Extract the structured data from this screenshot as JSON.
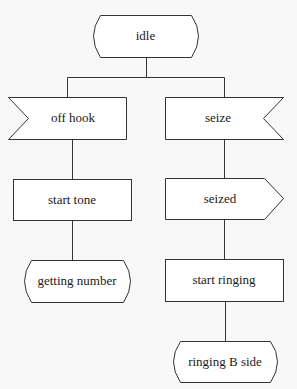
{
  "diagram": {
    "type": "SDL state transition diagram",
    "nodes": [
      {
        "id": "idle",
        "label": "idle",
        "shape": "state",
        "x": 86,
        "y": 15,
        "w": 119,
        "h": 42
      },
      {
        "id": "off_hook",
        "label": "off hook",
        "shape": "input-signal-left",
        "x": 8,
        "y": 97,
        "w": 118,
        "h": 42
      },
      {
        "id": "seize",
        "label": "seize",
        "shape": "input-signal-right",
        "x": 165,
        "y": 97,
        "w": 118,
        "h": 42
      },
      {
        "id": "start_tone",
        "label": "start tone",
        "shape": "task",
        "x": 13,
        "y": 179,
        "w": 118,
        "h": 41
      },
      {
        "id": "seized",
        "label": "seized",
        "shape": "output-signal",
        "x": 165,
        "y": 178,
        "w": 118,
        "h": 41
      },
      {
        "id": "getting_number",
        "label": "getting number",
        "shape": "state",
        "x": 17,
        "y": 260,
        "w": 120,
        "h": 42
      },
      {
        "id": "start_ringing",
        "label": "start ringing",
        "shape": "task",
        "x": 165,
        "y": 259,
        "w": 118,
        "h": 42
      },
      {
        "id": "ringing_b_side",
        "label": "ringing B side",
        "shape": "state",
        "x": 166,
        "y": 341,
        "w": 118,
        "h": 41
      }
    ],
    "edges": [
      {
        "from": "idle",
        "to": "off_hook"
      },
      {
        "from": "idle",
        "to": "seize"
      },
      {
        "from": "off_hook",
        "to": "start_tone"
      },
      {
        "from": "start_tone",
        "to": "getting_number"
      },
      {
        "from": "seize",
        "to": "seized"
      },
      {
        "from": "seized",
        "to": "start_ringing"
      },
      {
        "from": "start_ringing",
        "to": "ringing_b_side"
      }
    ]
  },
  "labels": {
    "idle": "idle",
    "off_hook": "off hook",
    "seize": "seize",
    "start_tone": "start tone",
    "seized": "seized",
    "getting_number": "getting number",
    "start_ringing": "start ringing",
    "ringing_b_side": "ringing B side"
  }
}
